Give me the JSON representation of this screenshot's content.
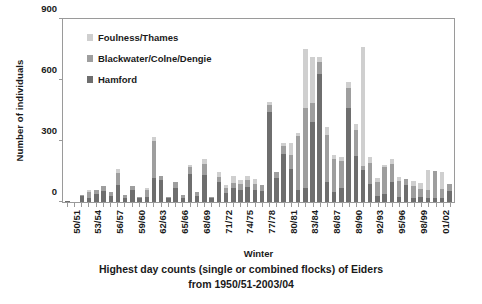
{
  "chart_data": {
    "type": "bar",
    "stacked": true,
    "title": "",
    "xlabel": "Winter",
    "ylabel": "Number of individuals",
    "ylim": [
      0,
      900
    ],
    "yticks": [
      0,
      300,
      600,
      900
    ],
    "grid": false,
    "legend_position": "inside-top-left",
    "legend": [
      "Foulness/Thames",
      "Blackwater/Colne/Dengie",
      "Hamford"
    ],
    "categories": [
      "50/51",
      "51/52",
      "52/53",
      "53/54",
      "54/55",
      "55/56",
      "56/57",
      "57/58",
      "58/59",
      "59/60",
      "60/61",
      "61/62",
      "62/63",
      "63/64",
      "64/65",
      "65/66",
      "66/67",
      "67/68",
      "68/69",
      "69/70",
      "70/71",
      "71/72",
      "72/73",
      "73/74",
      "74/75",
      "75/76",
      "76/77",
      "77/78",
      "78/79",
      "79/80",
      "80/81",
      "81/82",
      "82/83",
      "83/84",
      "84/85",
      "85/86",
      "86/87",
      "87/88",
      "88/89",
      "89/90",
      "90/91",
      "91/92",
      "92/93",
      "93/94",
      "94/95",
      "95/96",
      "96/97",
      "97/98",
      "98/99",
      "99/00",
      "00/01",
      "01/02",
      "02/03",
      "03/04"
    ],
    "xtick_labels_shown": [
      "50/51",
      "53/54",
      "56/57",
      "59/60",
      "62/63",
      "65/66",
      "68/69",
      "71/72",
      "74/75",
      "77/78",
      "80/81",
      "83/84",
      "86/87",
      "89/90",
      "92/93",
      "95/96",
      "98/99",
      "01/02"
    ],
    "xtick_label_interval": 3,
    "series": [
      {
        "name": "Hamford",
        "color": "#6e6e6e",
        "values": [
          4,
          0,
          30,
          18,
          40,
          55,
          30,
          85,
          22,
          60,
          18,
          25,
          120,
          110,
          18,
          70,
          20,
          140,
          30,
          135,
          18,
          100,
          45,
          70,
          60,
          75,
          60,
          55,
          445,
          120,
          235,
          160,
          60,
          70,
          395,
          630,
          100,
          50,
          70,
          460,
          225,
          155,
          90,
          30,
          40,
          100,
          25,
          85,
          18,
          25,
          22,
          20,
          22,
          55
        ]
      },
      {
        "name": "Blackwater/Colne/Dengie",
        "color": "#9e9e9e",
        "values": [
          0,
          0,
          6,
          30,
          18,
          22,
          18,
          60,
          14,
          20,
          8,
          35,
          180,
          20,
          8,
          30,
          14,
          30,
          20,
          50,
          6,
          25,
          25,
          25,
          30,
          35,
          30,
          30,
          30,
          30,
          40,
          70,
          265,
          390,
          90,
          60,
          230,
          160,
          130,
          100,
          130,
          20,
          100,
          70,
          130,
          85,
          80,
          30,
          60,
          40,
          35,
          135,
          40,
          35
        ]
      },
      {
        "name": "Foulness/Thames",
        "color": "#cfcfcf",
        "values": [
          0,
          0,
          0,
          12,
          0,
          0,
          0,
          15,
          0,
          0,
          0,
          10,
          20,
          0,
          0,
          0,
          0,
          10,
          0,
          25,
          0,
          25,
          15,
          35,
          20,
          20,
          25,
          0,
          15,
          0,
          15,
          60,
          15,
          295,
          230,
          25,
          40,
          20,
          20,
          30,
          30,
          585,
          30,
          20,
          10,
          25,
          20,
          0,
          25,
          30,
          100,
          0,
          85,
          0
        ]
      }
    ]
  },
  "axis": {
    "ylabel": "Number of individuals",
    "xlabel": "Winter",
    "yticks": [
      "900",
      "600",
      "300",
      "0"
    ]
  },
  "legend": {
    "entries": [
      {
        "label": "Foulness/Thames"
      },
      {
        "label": "Blackwater/Colne/Dengie"
      },
      {
        "label": "Hamford"
      }
    ]
  },
  "caption": {
    "line1": "Highest day counts (single or combined flocks) of Eiders",
    "line2": "from 1950/51-2003/04"
  }
}
